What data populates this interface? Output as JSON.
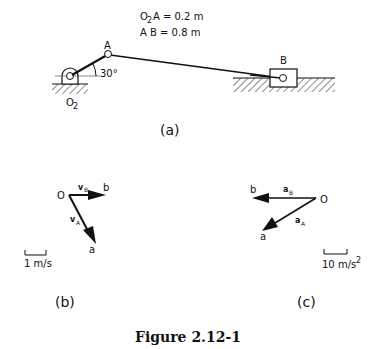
{
  "figure": {
    "caption": "Figure 2.12-1",
    "given": {
      "line1_prefix": "O",
      "line1_sub": "2",
      "line1_rest": "A  =  0.2 m",
      "line2": "A B   =  0.8 m"
    }
  },
  "panel_a": {
    "label": "(a)",
    "pivot_label": "O",
    "pivot_sub": "2",
    "point_a": "A",
    "point_b": "B",
    "angle": "30°",
    "O2A_m": 0.2,
    "AB_m": 0.8,
    "crank_angle_deg": 30
  },
  "panel_b": {
    "label": "(b)",
    "origin": "O",
    "vb_label": "v",
    "vb_sub": "B",
    "va_label": "v",
    "va_sub": "A",
    "end_b": "b",
    "end_a": "a",
    "scale": "1 m/s"
  },
  "panel_c": {
    "label": "(c)",
    "origin": "O",
    "ab_label": "a",
    "ab_sub": "B",
    "aa_label": "a",
    "aa_sub": "A",
    "end_b": "b",
    "end_a": "a",
    "scale": "10 m/s",
    "scale_sup": "2"
  }
}
